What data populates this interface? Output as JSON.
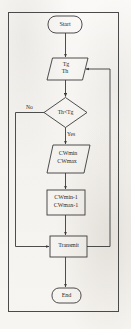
{
  "diagram": {
    "background_color": "#f7f6f3",
    "line_color": "#3a3a3a",
    "text_color": "#2e2e2e",
    "nodes": [
      {
        "id": "start",
        "type": "terminal",
        "label": "Start"
      },
      {
        "id": "input_t",
        "type": "io",
        "line1": "Tg",
        "line2": "Th"
      },
      {
        "id": "decision",
        "type": "decision",
        "label": "Th<Tg"
      },
      {
        "id": "input_cw",
        "type": "io",
        "line1": "CWmin",
        "line2": "CWmax"
      },
      {
        "id": "process",
        "type": "process",
        "line1": "CWmin-1",
        "line2": "CWmax-1"
      },
      {
        "id": "transmit",
        "type": "process",
        "label": "Transmit"
      },
      {
        "id": "end",
        "type": "terminal",
        "label": "End"
      }
    ],
    "branch_labels": {
      "no": "No",
      "yes": "Yes"
    },
    "edges": [
      {
        "from": "start",
        "to": "input_t",
        "label": ""
      },
      {
        "from": "input_t",
        "to": "decision",
        "label": ""
      },
      {
        "from": "decision",
        "to": "transmit",
        "label": "No"
      },
      {
        "from": "decision",
        "to": "input_cw",
        "label": "Yes"
      },
      {
        "from": "input_cw",
        "to": "process",
        "label": ""
      },
      {
        "from": "process",
        "to": "transmit",
        "label": ""
      },
      {
        "from": "transmit",
        "to": "input_t",
        "label": ""
      },
      {
        "from": "transmit",
        "to": "end",
        "label": ""
      }
    ]
  }
}
